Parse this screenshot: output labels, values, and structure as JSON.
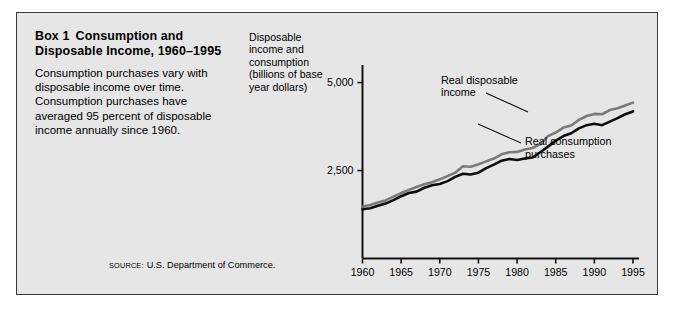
{
  "box": {
    "title_kicker": "Box 1",
    "title_main": "Consumption and Disposable Income, 1960–1995",
    "body": "Consumption purchases vary with disposable income over time. Consumption purchases have averaged 95 percent of disposable income annually since 1960."
  },
  "axis_caption": "Disposable income and consumption (billions of base year dollars)",
  "source": {
    "kicker": "SOURCE:",
    "text": "U.S. Department of Commerce."
  },
  "colors": {
    "panel_background": "#e6e6e6",
    "panel_border": "#3a3a3a",
    "page_background": "#ffffff",
    "disposable_income_line": "#7a7a7a",
    "consumption_line": "#0d0d0d",
    "axis": "#111111",
    "text": "#000000"
  },
  "chart_data": {
    "type": "line",
    "title": "",
    "subtitle": "",
    "xlabel": "",
    "ylabel": "Disposable income and consumption (billions of base year dollars)",
    "xlim": [
      1960,
      1995
    ],
    "ylim": [
      0,
      5500
    ],
    "xticks": [
      1960,
      1965,
      1970,
      1975,
      1980,
      1985,
      1990,
      1995
    ],
    "xtick_labels": [
      "1960",
      "1965",
      "1970",
      "1975",
      "1980",
      "1985",
      "1990",
      "1995"
    ],
    "yticks": [
      2500,
      5000
    ],
    "ytick_labels": [
      "2,500",
      "5,000"
    ],
    "grid": false,
    "legend_position": "inline-annotations",
    "annotations": [
      {
        "label": "Real disposable income",
        "series": "Real disposable income"
      },
      {
        "label": "Real consumption purchases",
        "series": "Real consumption purchases"
      }
    ],
    "x": [
      1960,
      1961,
      1962,
      1963,
      1964,
      1965,
      1966,
      1967,
      1968,
      1969,
      1970,
      1971,
      1972,
      1973,
      1974,
      1975,
      1976,
      1977,
      1978,
      1979,
      1980,
      1981,
      1982,
      1983,
      1984,
      1985,
      1986,
      1987,
      1988,
      1989,
      1990,
      1991,
      1992,
      1993,
      1994,
      1995
    ],
    "series": [
      {
        "name": "Real disposable income",
        "color": "#7a7a7a",
        "values": [
          1480,
          1520,
          1590,
          1650,
          1760,
          1860,
          1950,
          2030,
          2110,
          2170,
          2250,
          2340,
          2440,
          2620,
          2610,
          2680,
          2760,
          2840,
          2960,
          3020,
          3030,
          3100,
          3140,
          3250,
          3480,
          3580,
          3720,
          3780,
          3940,
          4050,
          4110,
          4100,
          4220,
          4270,
          4350,
          4430
        ]
      },
      {
        "name": "Real consumption purchases",
        "color": "#0d0d0d",
        "values": [
          1400,
          1430,
          1500,
          1560,
          1660,
          1770,
          1860,
          1900,
          2010,
          2080,
          2120,
          2200,
          2320,
          2410,
          2390,
          2440,
          2570,
          2670,
          2780,
          2830,
          2800,
          2840,
          2870,
          3020,
          3180,
          3350,
          3480,
          3560,
          3700,
          3790,
          3830,
          3790,
          3890,
          3990,
          4100,
          4180
        ]
      }
    ]
  }
}
